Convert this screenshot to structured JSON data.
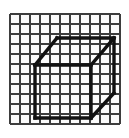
{
  "figure": {
    "type": "line-drawing",
    "width": 129,
    "height": 138,
    "background_color": "#ffffff"
  },
  "grid": {
    "name": "graph-paper-grid",
    "columns": 11,
    "rows": 11,
    "origin_x": 10,
    "origin_y": 14,
    "cell_size": 10,
    "line_color": "#3d3d3d",
    "line_width": 1.6,
    "cell_fill": "#fbfbfb",
    "border_color": "#3d3d3d",
    "border_width": 2
  },
  "cube": {
    "name": "wireframe-cube",
    "stroke_color": "#111111",
    "stroke_width": 3.4,
    "front_face": {
      "label": "front-face-square",
      "left": 35,
      "top": 65,
      "right": 91,
      "bottom": 118
    },
    "back_face": {
      "label": "back-face-square",
      "left": 57,
      "top": 38,
      "right": 114,
      "bottom": 93
    },
    "depth_offset_x": 23,
    "depth_offset_y": -27,
    "edges": [
      {
        "name": "front-top-edge",
        "x1": 35,
        "y1": 65,
        "x2": 91,
        "y2": 65
      },
      {
        "name": "front-left-edge",
        "x1": 35,
        "y1": 65,
        "x2": 35,
        "y2": 118
      },
      {
        "name": "front-bottom-edge",
        "x1": 35,
        "y1": 118,
        "x2": 91,
        "y2": 118
      },
      {
        "name": "front-right-edge",
        "x1": 91,
        "y1": 65,
        "x2": 91,
        "y2": 118
      },
      {
        "name": "back-top-edge",
        "x1": 57,
        "y1": 38,
        "x2": 114,
        "y2": 38
      },
      {
        "name": "back-right-edge",
        "x1": 114,
        "y1": 38,
        "x2": 114,
        "y2": 93
      },
      {
        "name": "top-left-connector",
        "x1": 35,
        "y1": 65,
        "x2": 57,
        "y2": 38
      },
      {
        "name": "top-right-connector",
        "x1": 91,
        "y1": 65,
        "x2": 114,
        "y2": 38
      },
      {
        "name": "bottom-right-connector",
        "x1": 91,
        "y1": 118,
        "x2": 114,
        "y2": 93
      }
    ]
  }
}
